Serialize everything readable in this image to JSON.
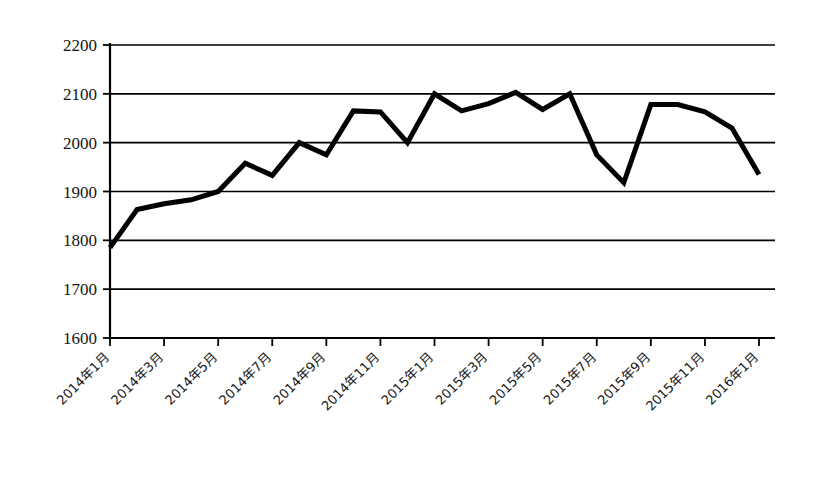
{
  "chart_data": {
    "type": "line",
    "title": "",
    "subtitle": "",
    "xlabel": "",
    "ylabel": "",
    "ylim": [
      1600,
      2200
    ],
    "ytick_values": [
      2200,
      2100,
      2000,
      1900,
      1800,
      1700,
      1600
    ],
    "ytick_labels": [
      "2200",
      "2100",
      "2000",
      "1900",
      "1800",
      "1700",
      "1600"
    ],
    "grid": "horizontal",
    "legend": "none",
    "line_color": "#000000",
    "line_width": 5,
    "background_color": "#ffffff",
    "axis_color": "#000000",
    "xtick_labels": [
      "2014年1月",
      "2014年3月",
      "2014年5月",
      "2014年7月",
      "2014年9月",
      "2014年11月",
      "2015年1月",
      "2015年3月",
      "2015年5月",
      "2015年7月",
      "2015年9月",
      "2015年11月",
      "2016年1月"
    ],
    "xtick_label_rotation": -45,
    "categories": [
      "2014年1月",
      "2014年2月",
      "2014年3月",
      "2014年4月",
      "2014年5月",
      "2014年6月",
      "2014年7月",
      "2014年8月",
      "2014年9月",
      "2014年10月",
      "2014年11月",
      "2014年12月",
      "2015年1月",
      "2015年2月",
      "2015年3月",
      "2015年4月",
      "2015年5月",
      "2015年6月",
      "2015年7月",
      "2015年8月",
      "2015年9月",
      "2015年10月",
      "2015年11月",
      "2015年12月",
      "2016年1月"
    ],
    "values": [
      1785,
      1863,
      1875,
      1883,
      1900,
      1958,
      1933,
      2000,
      1975,
      2065,
      2063,
      2000,
      2100,
      2065,
      2080,
      2103,
      2068,
      2100,
      1975,
      1918,
      2078,
      2078,
      2063,
      2030,
      1935
    ]
  }
}
